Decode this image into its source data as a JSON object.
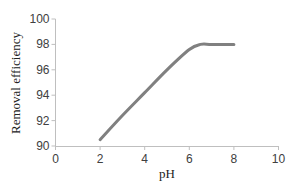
{
  "chart_data": {
    "type": "line",
    "title": "",
    "xlabel": "pH",
    "ylabel": "Removal efficiency",
    "xlim": [
      0,
      10
    ],
    "ylim": [
      90,
      100
    ],
    "xticks": [
      "0",
      "2",
      "4",
      "6",
      "8",
      "10"
    ],
    "yticks": [
      "90",
      "92",
      "94",
      "96",
      "98",
      "100"
    ],
    "grid": false,
    "legend": null,
    "series": [
      {
        "name": "Removal efficiency",
        "color": "#808080",
        "x": [
          2,
          3,
          4,
          5,
          6,
          6.5,
          7,
          8
        ],
        "y": [
          90.5,
          92.4,
          94.2,
          96.0,
          97.6,
          98.0,
          98.0,
          98.0
        ]
      }
    ]
  },
  "colors": {
    "line": "#808080",
    "axis": "#bfbfbf",
    "text": "#404040"
  }
}
